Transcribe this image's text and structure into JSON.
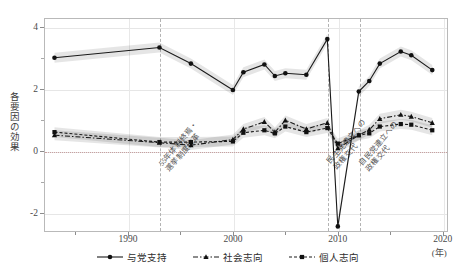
{
  "axes": {
    "ylabel": "各要因の効果",
    "xlabel_unit": "(年)",
    "yticks_major": [
      "4",
      "2",
      "0",
      "-2"
    ],
    "ytick_values": [
      4,
      2,
      0,
      -2
    ],
    "ytick_minor_values": [
      3,
      1,
      -1
    ],
    "xticks": [
      "1990",
      "2000",
      "2010",
      "2020"
    ],
    "xtick_values": [
      1990,
      2000,
      2010,
      2020
    ],
    "xlim": [
      1982,
      2020.5
    ],
    "ylim": [
      -2.6,
      4.3
    ],
    "grid": "light gridlines at major ticks"
  },
  "zero_line": {
    "value": 0,
    "color": "#c9a0a0",
    "style": "dotted"
  },
  "annotations": [
    {
      "name": "annot-1993",
      "year": 1993,
      "line1": "55年体制終焉・",
      "line2": "選挙制度改革"
    },
    {
      "name": "annot-2009",
      "year": 2009,
      "line1": "民主党連立への",
      "line2": "政権交代"
    },
    {
      "name": "annot-2012",
      "year": 2012,
      "line1": "自民党連立への",
      "line2": "政権交代"
    }
  ],
  "legend": {
    "items": [
      {
        "label": "与党支持",
        "marker": "circle",
        "dash": "solid",
        "color": "#1a1a1a"
      },
      {
        "label": "社会志向",
        "marker": "triangle",
        "dash": "dashdot",
        "color": "#1a1a1a"
      },
      {
        "label": "個人志向",
        "marker": "square",
        "dash": "dashed",
        "color": "#1a1a1a"
      }
    ]
  },
  "chart_data": {
    "type": "line",
    "title": "",
    "xlabel": "(年)",
    "ylabel": "各要因の効果",
    "xlim": [
      1982,
      2020.5
    ],
    "ylim": [
      -2.6,
      4.3
    ],
    "grid": true,
    "legend_position": "bottom-center",
    "series": [
      {
        "name": "与党支持",
        "marker": "circle",
        "dash": "solid",
        "band": true,
        "x": [
          1983,
          1993,
          1996,
          2000,
          2001,
          2003,
          2004,
          2005,
          2007,
          2009,
          2010,
          2012,
          2013,
          2014,
          2016,
          2017,
          2019
        ],
        "values": [
          3.02,
          3.35,
          2.83,
          1.98,
          2.55,
          2.8,
          2.43,
          2.52,
          2.47,
          3.62,
          -2.42,
          1.93,
          2.27,
          2.83,
          3.22,
          3.1,
          2.62
        ]
      },
      {
        "name": "社会志向",
        "marker": "triangle",
        "dash": "dashdot",
        "band": true,
        "x": [
          1983,
          1993,
          1996,
          2000,
          2001,
          2003,
          2004,
          2005,
          2007,
          2009,
          2010,
          2012,
          2013,
          2014,
          2016,
          2017,
          2019
        ],
        "values": [
          0.52,
          0.28,
          0.2,
          0.38,
          0.72,
          0.95,
          0.62,
          1.0,
          0.72,
          0.92,
          0.1,
          0.52,
          0.7,
          1.05,
          1.18,
          1.12,
          0.92
        ]
      },
      {
        "name": "個人志向",
        "marker": "square",
        "dash": "dashed",
        "band": true,
        "x": [
          1983,
          1993,
          1996,
          2000,
          2001,
          2003,
          2004,
          2005,
          2007,
          2009,
          2010,
          2012,
          2013,
          2014,
          2016,
          2017,
          2019
        ],
        "values": [
          0.62,
          0.3,
          0.3,
          0.32,
          0.6,
          0.68,
          0.58,
          0.8,
          0.62,
          0.75,
          0.25,
          0.52,
          0.58,
          0.8,
          0.88,
          0.86,
          0.68
        ]
      }
    ]
  }
}
